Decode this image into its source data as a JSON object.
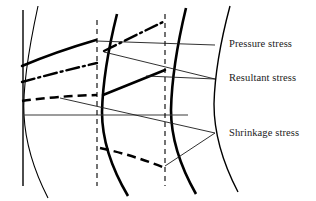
{
  "figure": {
    "kind": "technical-line-diagram",
    "background_color": "#ffffff",
    "ink_color": "#000000"
  },
  "labels": [
    {
      "id": "pressure",
      "text": "Pressure stress",
      "x": 229,
      "y": 38
    },
    {
      "id": "resultant",
      "text": "Resultant stress",
      "x": 229,
      "y": 72
    },
    {
      "id": "shrinkage",
      "text": "Shrinkage stress",
      "x": 229,
      "y": 127
    }
  ],
  "legend_curve_styles": {
    "pressure_stress": "solid-thick",
    "resultant_stress": "dash-dot-thick",
    "shrinkage_stress": "dashed-thick"
  },
  "axes": {
    "vertical_axis": {
      "x": 23,
      "y_top": 10,
      "y_bottom": 186,
      "style": "solid-thin"
    },
    "zero_line": {
      "y": 115,
      "x_start": 23,
      "x_end": 188,
      "style": "solid-thin"
    }
  },
  "boundary_arcs": [
    {
      "id": "arc-inner",
      "style": "solid-thin",
      "x_top": 38,
      "x_mid": 24,
      "x_bottom": 48
    },
    {
      "id": "arc-first",
      "style": "solid-thick",
      "x_top": 117,
      "x_mid": 102,
      "x_bottom": 128
    },
    {
      "id": "arc-second",
      "style": "solid-thick",
      "x_top": 186,
      "x_mid": 171,
      "x_bottom": 196
    },
    {
      "id": "arc-outer",
      "style": "solid-thin",
      "x_top": 230,
      "x_mid": 214,
      "x_bottom": 238
    }
  ],
  "station_lines": [
    {
      "id": "station-1",
      "x": 97,
      "y_top": 20,
      "y_bottom": 186,
      "style": "dashed-thin"
    },
    {
      "id": "station-2",
      "x": 165,
      "y_top": 14,
      "y_bottom": 186,
      "style": "dashed-thin"
    }
  ],
  "curves": {
    "pressure_stress": [
      {
        "band": 1,
        "points": "22,66 40,57 60,49 80,43 96,40"
      },
      {
        "band": 2,
        "points": "103,95 120,88 140,80 158,73 165,70"
      }
    ],
    "resultant_stress": [
      {
        "band": 1,
        "points": "22,82 42,76 62,70 82,66 97,63"
      },
      {
        "band": 2,
        "points": "104,51 120,43 140,33 156,26 163,22"
      }
    ],
    "shrinkage_stress": [
      {
        "band": 1,
        "points": "22,101 42,98 62,96 80,95 97,95"
      },
      {
        "band": 2,
        "points": "100,148 118,152 138,158 156,165 165,168"
      }
    ]
  },
  "leader_lines": [
    {
      "target": "pressure",
      "points": "96,41 215,45"
    },
    {
      "target": "resultant",
      "points": "104,52 215,79"
    },
    {
      "target": "resultant",
      "points": "146,76 215,79"
    },
    {
      "target": "shrinkage",
      "points": "60,98 215,133"
    },
    {
      "target": "shrinkage",
      "points": "165,166 215,133"
    }
  ]
}
